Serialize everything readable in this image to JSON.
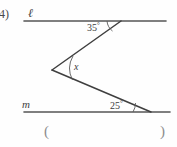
{
  "problem": {
    "number": "4)"
  },
  "labels": {
    "line_top": "ℓ",
    "line_bottom": "m",
    "angle_top": "35",
    "angle_vertex": "x",
    "angle_bottom": "25",
    "degree_symbol": "°"
  },
  "answer_blank": {
    "open": "(",
    "close": ")",
    "value": ""
  },
  "colors": {
    "ink": "#3a3a3a",
    "line": "#4a4a4a",
    "paren": "#8d8d8d",
    "background": "#fefefe"
  },
  "geometry": {
    "line_l": {
      "x1": 24,
      "y1": 21,
      "x2": 166,
      "y2": 21
    },
    "line_m": {
      "x1": 24,
      "y1": 112,
      "x2": 170,
      "y2": 112
    },
    "zig_upper": {
      "x1": 121,
      "y1": 21,
      "x2": 52,
      "y2": 70
    },
    "zig_lower": {
      "x1": 52,
      "y1": 70,
      "x2": 151,
      "y2": 112
    }
  }
}
